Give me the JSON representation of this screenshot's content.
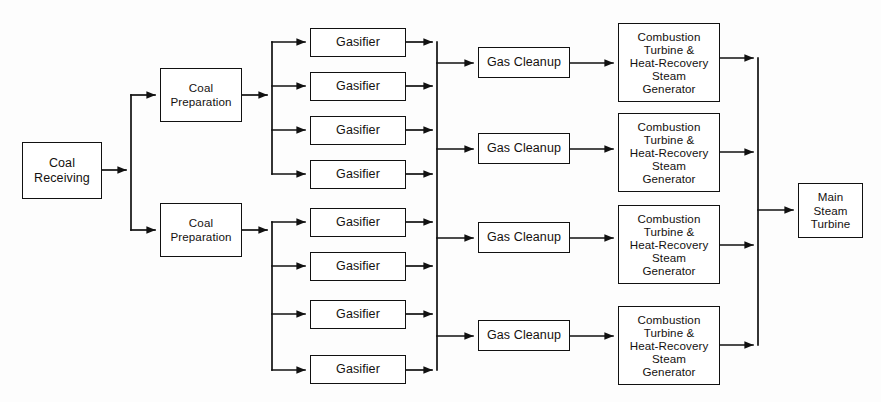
{
  "diagram": {
    "type": "process-block-flow",
    "background_color": "#fdfdfd",
    "line_color": "#111111",
    "box_fill": "#ffffff",
    "nodes": [
      {
        "id": "coal-receiving",
        "label": "Coal\nReceiving",
        "x": 22,
        "y": 142,
        "w": 80,
        "h": 57
      },
      {
        "id": "coal-preparation-1",
        "label": "Coal\nPreparation",
        "x": 160,
        "y": 68,
        "w": 82,
        "h": 54
      },
      {
        "id": "coal-preparation-2",
        "label": "Coal\nPreparation",
        "x": 160,
        "y": 203,
        "w": 82,
        "h": 54
      },
      {
        "id": "gasifier-1",
        "label": "Gasifier",
        "x": 310,
        "y": 28,
        "w": 96,
        "h": 29
      },
      {
        "id": "gasifier-2",
        "label": "Gasifier",
        "x": 310,
        "y": 72,
        "w": 96,
        "h": 29
      },
      {
        "id": "gasifier-3",
        "label": "Gasifier",
        "x": 310,
        "y": 116,
        "w": 96,
        "h": 29
      },
      {
        "id": "gasifier-4",
        "label": "Gasifier",
        "x": 310,
        "y": 160,
        "w": 96,
        "h": 29
      },
      {
        "id": "gasifier-5",
        "label": "Gasifier",
        "x": 310,
        "y": 208,
        "w": 96,
        "h": 29
      },
      {
        "id": "gasifier-6",
        "label": "Gasifier",
        "x": 310,
        "y": 252,
        "w": 96,
        "h": 29
      },
      {
        "id": "gasifier-7",
        "label": "Gasifier",
        "x": 310,
        "y": 300,
        "w": 96,
        "h": 29
      },
      {
        "id": "gasifier-8",
        "label": "Gasifier",
        "x": 310,
        "y": 355,
        "w": 96,
        "h": 29
      },
      {
        "id": "gas-cleanup-1",
        "label": "Gas Cleanup",
        "x": 478,
        "y": 47,
        "w": 92,
        "h": 31
      },
      {
        "id": "gas-cleanup-2",
        "label": "Gas Cleanup",
        "x": 478,
        "y": 133,
        "w": 92,
        "h": 31
      },
      {
        "id": "gas-cleanup-3",
        "label": "Gas Cleanup",
        "x": 478,
        "y": 222,
        "w": 92,
        "h": 31
      },
      {
        "id": "gas-cleanup-4",
        "label": "Gas Cleanup",
        "x": 478,
        "y": 320,
        "w": 92,
        "h": 31
      },
      {
        "id": "cthrsg-1",
        "label": "Combustion\nTurbine &\nHeat-Recovery\nSteam\nGenerator",
        "x": 618,
        "y": 23,
        "w": 102,
        "h": 79
      },
      {
        "id": "cthrsg-2",
        "label": "Combustion\nTurbine &\nHeat-Recovery\nSteam\nGenerator",
        "x": 618,
        "y": 113,
        "w": 102,
        "h": 79
      },
      {
        "id": "cthrsg-3",
        "label": "Combustion\nTurbine &\nHeat-Recovery\nSteam\nGenerator",
        "x": 618,
        "y": 205,
        "w": 102,
        "h": 79
      },
      {
        "id": "cthrsg-4",
        "label": "Combustion\nTurbine &\nHeat-Recovery\nSteam\nGenerator",
        "x": 618,
        "y": 306,
        "w": 102,
        "h": 79
      },
      {
        "id": "main-steam-turbine",
        "label": "Main\nSteam\nTurbine",
        "x": 798,
        "y": 183,
        "w": 65,
        "h": 55
      }
    ]
  }
}
